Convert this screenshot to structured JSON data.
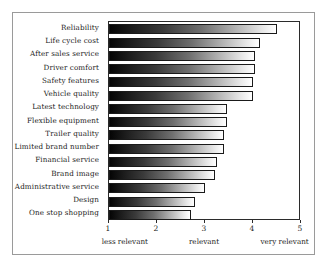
{
  "chart_data": {
    "type": "bar",
    "orientation": "horizontal",
    "title": "",
    "subtitle": "",
    "xlabel": "",
    "ylabel": "",
    "xlim": [
      1,
      5
    ],
    "grid": false,
    "legend": null,
    "categories": [
      "Reliability",
      "Life cycle cost",
      "After sales service",
      "Driver comfort",
      "Safety features",
      "Vehicle quality",
      "Latest technology",
      "Flexible equipment",
      "Trailer quality",
      "Limited brand number",
      "Financial service",
      "Brand image",
      "Administrative service",
      "Design",
      "One stop shopping"
    ],
    "values": [
      4.5,
      4.15,
      4.05,
      4.05,
      4.0,
      4.0,
      3.45,
      3.45,
      3.4,
      3.4,
      3.25,
      3.2,
      3.0,
      2.8,
      2.7
    ],
    "xticks": [
      1,
      2,
      3,
      4,
      5
    ],
    "xtick_labels": [
      "1",
      "2",
      "3",
      "4",
      "5"
    ],
    "axis_annotations": [
      {
        "label": "less relevant",
        "at": 1.35
      },
      {
        "label": "relevant",
        "at": 3.0
      },
      {
        "label": "very relevant",
        "at": 4.68
      }
    ],
    "bar_style": {
      "fill": "gradient-black-to-white",
      "gradient_start": "#050505",
      "gradient_end": "#ffffff",
      "edge_color": "#1a1a1a"
    },
    "frame_color": "#2b2b2b",
    "outer_border_color": "#9a9a9a",
    "background": "#ffffff"
  }
}
